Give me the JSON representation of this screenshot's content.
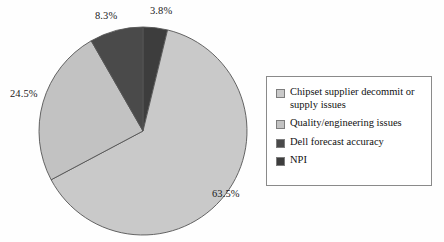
{
  "chart_data": {
    "type": "pie",
    "title": "",
    "subtitle": "",
    "xlabel": "",
    "ylabel": "",
    "grid": false,
    "legend_position": "right",
    "start_angle_deg": 0,
    "direction": "clockwise",
    "categories": [
      "Chipset supplier decommit or supply issues",
      "Quality/engineering issues",
      "Dell forecast accuracy",
      "NPI"
    ],
    "values": [
      63.5,
      24.5,
      8.3,
      3.8
    ],
    "value_labels": [
      "63.5%",
      "24.5%",
      "8.3%",
      "3.8%"
    ],
    "colors": [
      "#c9c9c9",
      "#c2c2c2",
      "#4a4a4a",
      "#3d3d3d"
    ],
    "slices": [
      {
        "label": "NPI",
        "value": 3.8,
        "display": "3.8%",
        "color": "#3d3d3d"
      },
      {
        "label": "Chipset supplier decommit or supply issues",
        "value": 63.5,
        "display": "63.5%",
        "color": "#c9c9c9"
      },
      {
        "label": "Quality/engineering issues",
        "value": 24.5,
        "display": "24.5%",
        "color": "#c2c2c2"
      },
      {
        "label": "Dell forecast accuracy",
        "value": 8.3,
        "display": "8.3%",
        "color": "#4a4a4a"
      }
    ]
  },
  "labels": {
    "npi": "3.8%",
    "dell": "8.3%",
    "quality": "24.5%",
    "chipset": "63.5%"
  },
  "legend": {
    "items": [
      {
        "label": "Chipset supplier decommit or supply issues",
        "color": "#c9c9c9"
      },
      {
        "label": "Quality/engineering issues",
        "color": "#c2c2c2"
      },
      {
        "label": "Dell forecast accuracy",
        "color": "#4a4a4a"
      },
      {
        "label": "NPI",
        "color": "#3d3d3d"
      }
    ]
  },
  "style": {
    "background": "#fefefe",
    "outline": "#555555",
    "legend_border": "#8a8a8a",
    "text": "#111111"
  }
}
